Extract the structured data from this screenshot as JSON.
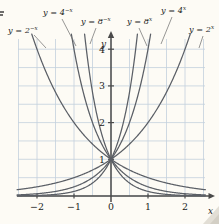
{
  "chart_data": {
    "type": "line",
    "title": "",
    "xlabel": "x",
    "ylabel": "y",
    "xlim": [
      -2.5,
      2.55
    ],
    "ylim": [
      -0.25,
      4.3
    ],
    "grid": true,
    "legend_position": "callout-labels-above-plot",
    "xticks": [
      -2,
      -1,
      0,
      1,
      2
    ],
    "xtick_labels": [
      "−2",
      "−1",
      "0",
      "1",
      "2"
    ],
    "yticks": [
      1,
      2,
      3,
      4
    ],
    "ytick_labels": [
      "1",
      "2",
      "3",
      "4"
    ],
    "series": [
      {
        "name": "y = 2^-x",
        "base": 2,
        "exponent_sign": -1,
        "label_text": "y = 2",
        "label_sup": "−x",
        "x": [
          -2.5,
          -2,
          -1.5,
          -1,
          -0.5,
          0,
          0.5,
          1,
          1.5,
          2,
          2.5
        ],
        "values": [
          5.657,
          4.0,
          2.828,
          2.0,
          1.414,
          1.0,
          0.707,
          0.5,
          0.354,
          0.25,
          0.177
        ]
      },
      {
        "name": "y = 4^-x",
        "base": 4,
        "exponent_sign": -1,
        "label_text": "y = 4",
        "label_sup": "−x",
        "x": [
          -1.5,
          -1.25,
          -1,
          -0.75,
          -0.5,
          -0.25,
          0,
          0.5,
          1,
          1.5,
          2,
          2.5
        ],
        "values": [
          8.0,
          5.657,
          4.0,
          2.828,
          2.0,
          1.414,
          1.0,
          0.5,
          0.25,
          0.125,
          0.0625,
          0.031
        ]
      },
      {
        "name": "y = 8^-x",
        "base": 8,
        "exponent_sign": -1,
        "label_text": "y = 8",
        "label_sup": "−x",
        "x": [
          -1.0,
          -0.85,
          -0.7,
          -0.55,
          -0.4,
          -0.25,
          0,
          0.5,
          1,
          1.5,
          2,
          2.5
        ],
        "values": [
          8.0,
          5.278,
          3.482,
          2.297,
          1.516,
          1.0,
          1.0,
          0.354,
          0.125,
          0.044,
          0.0156,
          0.0055
        ]
      },
      {
        "name": "y = 8^x",
        "base": 8,
        "exponent_sign": 1,
        "label_text": "y = 8",
        "label_sup": "x",
        "x": [
          -2.5,
          -2,
          -1.5,
          -1,
          -0.5,
          0,
          0.25,
          0.4,
          0.55,
          0.7,
          0.85,
          1.0
        ],
        "values": [
          0.0055,
          0.0156,
          0.044,
          0.125,
          0.354,
          1.0,
          1.682,
          2.297,
          3.482,
          5.278,
          8.0,
          8.0
        ]
      },
      {
        "name": "y = 4^x",
        "base": 4,
        "exponent_sign": 1,
        "label_text": "y = 4",
        "label_sup": "x",
        "x": [
          -2.5,
          -2,
          -1.5,
          -1,
          -0.5,
          0,
          0.25,
          0.5,
          0.75,
          1,
          1.25,
          1.5
        ],
        "values": [
          0.031,
          0.0625,
          0.125,
          0.25,
          0.5,
          1.0,
          1.414,
          2.0,
          2.828,
          4.0,
          5.657,
          8.0
        ]
      },
      {
        "name": "y = 2^x",
        "base": 2,
        "exponent_sign": 1,
        "label_text": "y = 2",
        "label_sup": "x",
        "x": [
          -2.5,
          -2,
          -1.5,
          -1,
          -0.5,
          0,
          0.5,
          1,
          1.5,
          2,
          2.5
        ],
        "values": [
          0.177,
          0.25,
          0.354,
          0.5,
          0.707,
          1.0,
          1.414,
          2.0,
          2.828,
          4.0,
          5.657
        ]
      }
    ],
    "annotations": [
      {
        "id": "lbl-2negx",
        "text": "y = 2",
        "sup": "−x",
        "x": 8,
        "y": 33
      },
      {
        "id": "lbl-4negx",
        "text": "y = 4",
        "sup": "−x",
        "x": 43,
        "y": 15
      },
      {
        "id": "lbl-8negx",
        "text": "y = 8",
        "sup": "−x",
        "x": 81,
        "y": 24
      },
      {
        "id": "lbl-8x",
        "text": "y = 8",
        "sup": "x",
        "x": 127,
        "y": 24
      },
      {
        "id": "lbl-4x",
        "text": "y = 4",
        "sup": "x",
        "x": 161,
        "y": 13
      },
      {
        "id": "lbl-2x",
        "text": "y = 2",
        "sup": "x",
        "x": 189,
        "y": 32
      }
    ],
    "colors": {
      "background": "#fdfbf5",
      "grid": "#c3d0dd",
      "axis": "#4a4a4a",
      "curve": "#5b5f66",
      "text": "#1b1b1b"
    }
  },
  "figure": {
    "x_axis_name": "x",
    "y_axis_name": "y"
  }
}
